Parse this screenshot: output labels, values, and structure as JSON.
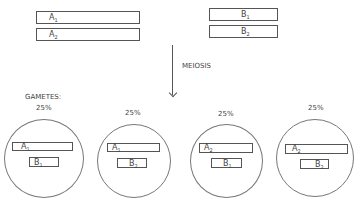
{
  "parents": {
    "chromosome_a": [
      {
        "gene": "A",
        "allele": "1"
      },
      {
        "gene": "A",
        "allele": "2"
      }
    ],
    "chromosome_b": [
      {
        "gene": "B",
        "allele": "1"
      },
      {
        "gene": "B",
        "allele": "2"
      }
    ]
  },
  "process": {
    "label": "MEIOSIS",
    "icon": "down-arrow-icon"
  },
  "gametes": {
    "title": "GAMETES:",
    "items": [
      {
        "percent": "25%",
        "a": {
          "gene": "A",
          "allele": "1"
        },
        "b": {
          "gene": "B",
          "allele": "1"
        }
      },
      {
        "percent": "25%",
        "a": {
          "gene": "A",
          "allele": "1"
        },
        "b": {
          "gene": "B",
          "allele": "2"
        }
      },
      {
        "percent": "25%",
        "a": {
          "gene": "A",
          "allele": "2"
        },
        "b": {
          "gene": "B",
          "allele": "1"
        }
      },
      {
        "percent": "25%",
        "a": {
          "gene": "A",
          "allele": "2"
        },
        "b": {
          "gene": "B",
          "allele": "2"
        }
      }
    ]
  }
}
